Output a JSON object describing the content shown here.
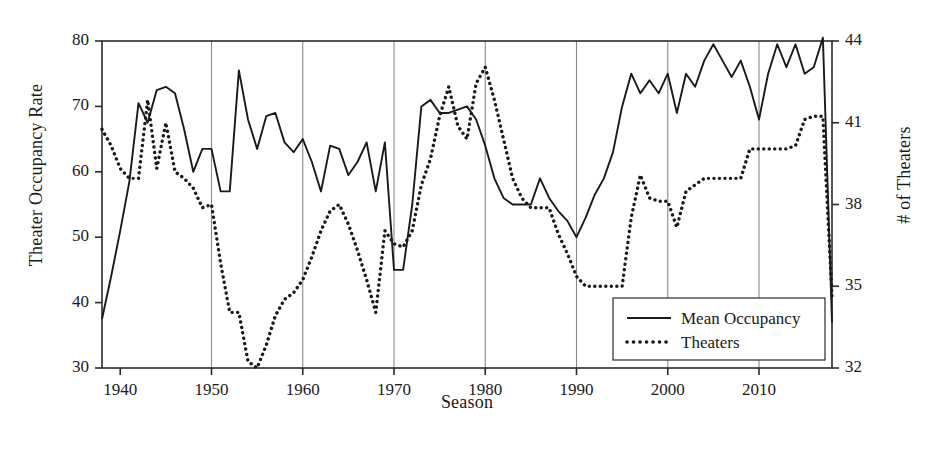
{
  "chart": {
    "type": "line",
    "title": "",
    "xlabel": "Season",
    "ylabel_left": "Theater Occupancy Rate",
    "ylabel_right": "# of Theaters",
    "background_color": "#ffffff",
    "line_color": "#1a1a1a",
    "grid_color": "#8a8a8a",
    "axis_color": "#2b2b2b",
    "grid": "vertical-only",
    "legend_position": "bottom-right",
    "xlim": [
      1938,
      2018
    ],
    "ylim_left": [
      30,
      80
    ],
    "ylim_right": [
      32,
      44
    ],
    "xticks": [
      "1940",
      "1950",
      "1960",
      "1970",
      "1980",
      "1990",
      "2000",
      "2010"
    ],
    "xtick_values": [
      1940,
      1950,
      1960,
      1970,
      1980,
      1990,
      2000,
      2010
    ],
    "yticks_left": [
      "30",
      "40",
      "50",
      "60",
      "70",
      "80"
    ],
    "ytick_left_values": [
      30,
      40,
      50,
      60,
      70,
      80
    ],
    "yticks_right": [
      "32",
      "35",
      "38",
      "41",
      "44"
    ],
    "ytick_right_values": [
      32,
      35,
      38,
      41,
      44
    ],
    "legend": [
      {
        "label": "Mean Occupancy",
        "style": "solid",
        "color": "#1a1a1a"
      },
      {
        "label": "Theaters",
        "style": "dotted",
        "color": "#1a1a1a"
      }
    ],
    "series": [
      {
        "name": "Mean Occupancy",
        "axis": "left",
        "style": "solid",
        "x": [
          1938,
          1939,
          1940,
          1941,
          1942,
          1943,
          1944,
          1945,
          1946,
          1947,
          1948,
          1949,
          1950,
          1951,
          1952,
          1953,
          1954,
          1955,
          1956,
          1957,
          1958,
          1959,
          1960,
          1961,
          1962,
          1963,
          1964,
          1965,
          1966,
          1967,
          1968,
          1969,
          1970,
          1971,
          1972,
          1973,
          1974,
          1975,
          1976,
          1977,
          1978,
          1979,
          1980,
          1981,
          1982,
          1983,
          1984,
          1985,
          1986,
          1987,
          1988,
          1989,
          1990,
          1991,
          1992,
          1993,
          1994,
          1995,
          1996,
          1997,
          1998,
          1999,
          2000,
          2001,
          2002,
          2003,
          2004,
          2005,
          2006,
          2007,
          2008,
          2009,
          2010,
          2011,
          2012,
          2013,
          2014,
          2015,
          2016,
          2017,
          2018
        ],
        "values": [
          37.5,
          44.0,
          51.0,
          58.5,
          70.5,
          67.5,
          72.5,
          73.0,
          72.0,
          66.5,
          60.0,
          63.5,
          63.5,
          57.0,
          57.0,
          75.5,
          68.0,
          63.5,
          68.5,
          69.0,
          64.5,
          63.0,
          65.0,
          61.5,
          57.0,
          64.0,
          63.5,
          59.5,
          61.5,
          64.5,
          57.0,
          64.5,
          45.0,
          45.0,
          55.0,
          70.0,
          71.0,
          69.0,
          69.0,
          69.5,
          70.0,
          68.0,
          64.0,
          59.0,
          56.0,
          55.0,
          55.0,
          55.0,
          59.0,
          56.0,
          54.0,
          52.5,
          50.0,
          53.0,
          56.5,
          59.0,
          63.0,
          70.0,
          75.0,
          72.0,
          74.0,
          72.0,
          75.0,
          69.0,
          75.0,
          73.0,
          77.0,
          79.5,
          77.0,
          74.5,
          77.0,
          73.0,
          68.0,
          75.0,
          79.5,
          76.0,
          79.5,
          75.0,
          76.0,
          80.5,
          37.0
        ]
      },
      {
        "name": "Theaters",
        "axis": "right",
        "style": "dotted",
        "x": [
          1938,
          1939,
          1940,
          1941,
          1942,
          1943,
          1944,
          1945,
          1946,
          1947,
          1948,
          1949,
          1950,
          1951,
          1952,
          1953,
          1954,
          1955,
          1956,
          1957,
          1958,
          1959,
          1960,
          1961,
          1962,
          1963,
          1964,
          1965,
          1966,
          1967,
          1968,
          1969,
          1970,
          1971,
          1972,
          1973,
          1974,
          1975,
          1976,
          1977,
          1978,
          1979,
          1980,
          1981,
          1982,
          1983,
          1984,
          1985,
          1986,
          1987,
          1988,
          1989,
          1990,
          1991,
          1992,
          1993,
          1994,
          1995,
          1996,
          1997,
          1998,
          1999,
          2000,
          2001,
          2002,
          2003,
          2004,
          2005,
          2006,
          2007,
          2008,
          2009,
          2010,
          2011,
          2012,
          2013,
          2014,
          2015,
          2016,
          2017,
          2018
        ],
        "values_left_scale": [
          66.5,
          64.0,
          60.5,
          59.0,
          59.0,
          71.0,
          60.5,
          67.5,
          60.0,
          59.0,
          57.5,
          54.5,
          55.0,
          46.0,
          38.5,
          38.5,
          31.0,
          30.0,
          33.5,
          38.0,
          40.5,
          41.5,
          43.5,
          47.0,
          51.0,
          54.0,
          55.0,
          52.0,
          48.0,
          43.5,
          38.5,
          51.0,
          49.0,
          48.5,
          51.0,
          58.0,
          62.0,
          68.5,
          73.0,
          67.0,
          65.0,
          73.5,
          76.0,
          71.0,
          65.0,
          59.0,
          56.0,
          54.5,
          54.5,
          54.5,
          50.5,
          47.5,
          44.0,
          42.5,
          42.5,
          42.5,
          42.5,
          42.5,
          53.0,
          59.5,
          56.0,
          55.5,
          55.5,
          51.5,
          57.0,
          58.0,
          59.0,
          59.0,
          59.0,
          59.0,
          59.0,
          63.5,
          63.5,
          63.5,
          63.5,
          63.5,
          64.0,
          68.0,
          68.5,
          68.5,
          41.0
        ]
      }
    ]
  }
}
